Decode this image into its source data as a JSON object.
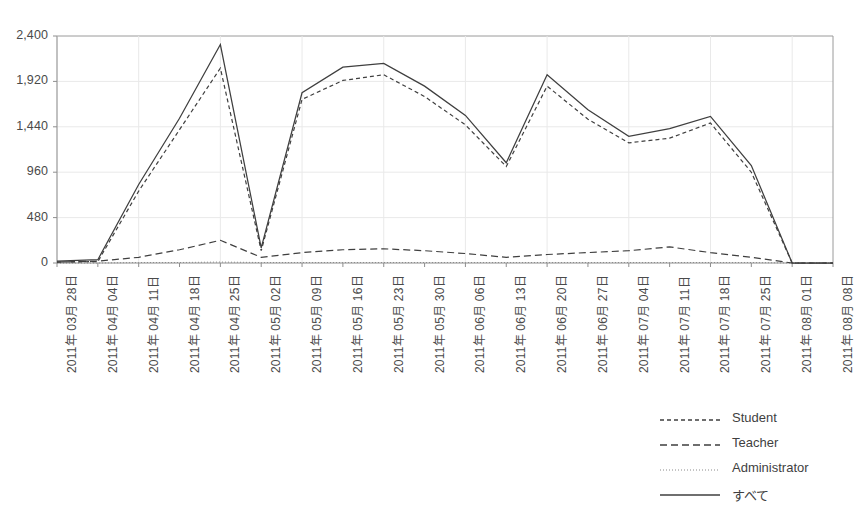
{
  "chart_data": {
    "type": "line",
    "title": "",
    "xlabel": "",
    "ylabel": "",
    "ylim": [
      0,
      2400
    ],
    "yticks": [
      0,
      480,
      960,
      1440,
      1920,
      2400
    ],
    "ytick_labels": [
      "0",
      "480",
      "960",
      "1,440",
      "1,920",
      "2,400"
    ],
    "grid": true,
    "legend_position": "bottom-right",
    "categories": [
      "2011年 03月 28日",
      "2011年 04月 04日",
      "2011年 04月 11日",
      "2011年 04月 18日",
      "2011年 04月 25日",
      "2011年 05月 02日",
      "2011年 05月 09日",
      "2011年 05月 16日",
      "2011年 05月 23日",
      "2011年 05月 30日",
      "2011年 06月 06日",
      "2011年 06月 13日",
      "2011年 06月 20日",
      "2011年 06月 27日",
      "2011年 07月 04日",
      "2011年 07月 11日",
      "2011年 07月 18日",
      "2011年 07月 25日",
      "2011年 08月 01日",
      "2011年 08月 08日"
    ],
    "series": [
      {
        "name": "Student",
        "style": "fine-dash",
        "color": "#3f3f3f",
        "values": [
          10,
          15,
          760,
          1410,
          2060,
          130,
          1730,
          1930,
          1990,
          1760,
          1460,
          1020,
          1870,
          1520,
          1270,
          1320,
          1480,
          960,
          0,
          0
        ]
      },
      {
        "name": "Teacher",
        "style": "dash",
        "color": "#3f3f3f",
        "values": [
          10,
          20,
          60,
          140,
          240,
          60,
          110,
          140,
          150,
          130,
          100,
          60,
          90,
          110,
          130,
          170,
          110,
          60,
          0,
          0
        ]
      },
      {
        "name": "Administrator",
        "style": "dot",
        "color": "#8a8a8a",
        "values": [
          0,
          0,
          5,
          5,
          10,
          5,
          5,
          5,
          5,
          5,
          5,
          5,
          5,
          5,
          5,
          5,
          5,
          5,
          0,
          0
        ]
      },
      {
        "name": "すべて",
        "style": "solid",
        "color": "#3f3f3f",
        "values": [
          20,
          35,
          830,
          1530,
          2310,
          160,
          1800,
          2070,
          2110,
          1870,
          1560,
          1060,
          1990,
          1620,
          1340,
          1420,
          1550,
          1030,
          0,
          0
        ]
      }
    ]
  },
  "legend": {
    "items": [
      {
        "label": "Student"
      },
      {
        "label": "Teacher"
      },
      {
        "label": "Administrator"
      },
      {
        "label": "すべて"
      }
    ]
  }
}
